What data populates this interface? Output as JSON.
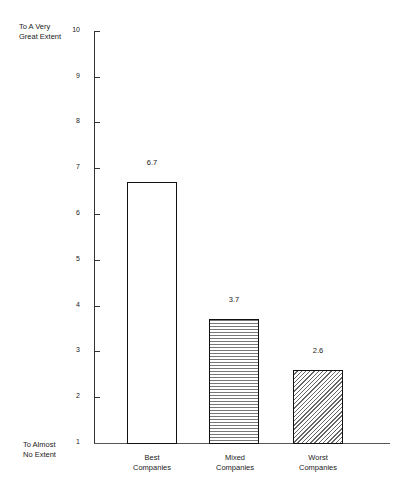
{
  "chart_data": {
    "type": "bar",
    "title": "",
    "xlabel": "",
    "ylabel": "",
    "y_top_label": "To A Very Great Extent",
    "y_bottom_label": "To Almost No Extent",
    "ylim": [
      1,
      10
    ],
    "yticks": [
      1,
      2,
      3,
      4,
      5,
      6,
      7,
      8,
      9,
      10
    ],
    "categories": [
      "Best Companies",
      "Mixed Companies",
      "Worst Companies"
    ],
    "values": [
      6.7,
      3.7,
      2.6
    ],
    "value_labels": [
      "6.7",
      "3.7",
      "2.6"
    ],
    "patterns": [
      "none",
      "horizontal-lines",
      "diagonal-lines"
    ],
    "grid": false
  },
  "labels": {
    "top1": "To A Very",
    "top2": "Great Extent",
    "bottom1": "To Almost",
    "bottom2": "No Extent",
    "cat0a": "Best",
    "cat0b": "Companies",
    "cat1a": "Mixed",
    "cat1b": "Companies",
    "cat2a": "Worst",
    "cat2b": "Companies"
  }
}
